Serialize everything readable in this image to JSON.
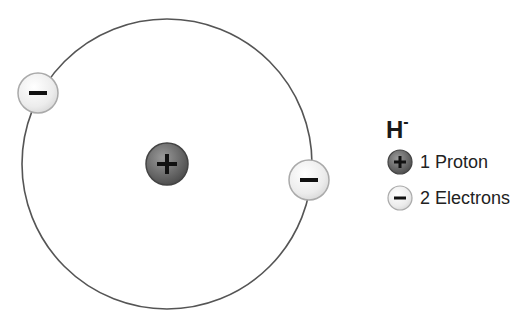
{
  "diagram": {
    "type": "atom-model",
    "species": "H-",
    "orbit": {
      "cx": 167,
      "cy": 164,
      "r": 145,
      "stroke": "#555555"
    },
    "nucleus": {
      "cx": 167,
      "cy": 164,
      "r": 21,
      "fill": "#6e6e6e",
      "symbol": "+"
    },
    "electrons": [
      {
        "cx": 38,
        "cy": 93,
        "r": 20,
        "fill": "#f0f0f0",
        "symbol": "−"
      },
      {
        "cx": 309,
        "cy": 180,
        "r": 20,
        "fill": "#f0f0f0",
        "symbol": "−"
      }
    ]
  },
  "legend": {
    "title_base": "H",
    "title_charge": "-",
    "items": [
      {
        "icon": "proton-icon",
        "symbol": "+",
        "label": "1 Proton"
      },
      {
        "icon": "electron-icon",
        "symbol": "−",
        "label": "2 Electrons"
      }
    ]
  }
}
